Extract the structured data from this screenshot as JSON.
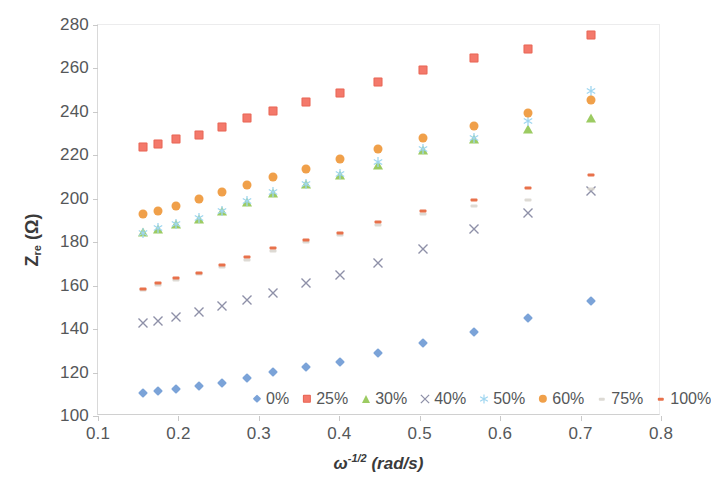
{
  "chart_data": {
    "type": "scatter",
    "title": "",
    "xlabel": "ω-1/2 (rad/s)",
    "ylabel": "Zre (Ω)",
    "xlim": [
      0.1,
      0.8
    ],
    "ylim": [
      100,
      280
    ],
    "xticks": [
      "0.1",
      "0.2",
      "0.3",
      "0.4",
      "0.5",
      "0.6",
      "0.7",
      "0.8"
    ],
    "yticks": [
      "100",
      "120",
      "140",
      "160",
      "180",
      "200",
      "220",
      "240",
      "260",
      "280"
    ],
    "grid": false,
    "legend_position": "bottom-inside",
    "x": [
      0.156,
      0.175,
      0.197,
      0.225,
      0.254,
      0.285,
      0.318,
      0.358,
      0.401,
      0.448,
      0.504,
      0.567,
      0.635,
      0.713
    ],
    "series": [
      {
        "name": "0%",
        "marker": "diamond",
        "color": "#7BA3D8",
        "values": [
          110.5,
          111.3,
          112.3,
          113.7,
          115.4,
          117.4,
          120.2,
          122.6,
          125.0,
          129.1,
          133.6,
          138.6,
          145.3,
          153.1
        ]
      },
      {
        "name": "25%",
        "marker": "square",
        "color": "#F4796B",
        "values": [
          223.9,
          225.2,
          227.4,
          229.4,
          232.9,
          237.0,
          240.6,
          244.7,
          248.9,
          253.6,
          259.2,
          264.6,
          269.0,
          275.2
        ]
      },
      {
        "name": "30%",
        "marker": "triangle",
        "color": "#9CCB62",
        "values": [
          184.8,
          186.0,
          188.3,
          190.6,
          194.4,
          198.5,
          202.6,
          207.0,
          211.0,
          215.7,
          222.4,
          227.4,
          232.3,
          237.0
        ]
      },
      {
        "name": "40%",
        "marker": "x",
        "color": "#8E90A8",
        "values": [
          142.8,
          143.6,
          145.5,
          147.7,
          150.6,
          153.4,
          156.5,
          161.2,
          165.1,
          170.6,
          176.7,
          185.9,
          193.5,
          203.6
        ]
      },
      {
        "name": "50%",
        "marker": "star",
        "color": "#9FD6F0",
        "values": [
          184.2,
          186.4,
          188.6,
          191.0,
          194.6,
          199.0,
          203.2,
          207.0,
          211.5,
          217.0,
          223.0,
          228.0,
          236.0,
          249.6
        ]
      },
      {
        "name": "60%",
        "marker": "circle",
        "color": "#F0A04A",
        "values": [
          193.0,
          194.4,
          196.9,
          200.0,
          203.3,
          206.4,
          210.0,
          213.8,
          218.2,
          223.0,
          228.0,
          233.5,
          239.5,
          245.3
        ]
      },
      {
        "name": "75%",
        "marker": "dash-faint",
        "color": "#D7D3CC",
        "values": [
          158.0,
          160.2,
          162.4,
          165.2,
          168.4,
          172.0,
          176.0,
          180.0,
          183.5,
          188.0,
          193.0,
          196.5,
          199.5,
          204.5
        ]
      },
      {
        "name": "100%",
        "marker": "dash",
        "color": "#E8714B",
        "values": [
          158.6,
          161.0,
          163.4,
          166.0,
          169.4,
          173.0,
          177.2,
          181.0,
          184.4,
          189.4,
          194.5,
          199.5,
          204.8,
          210.8
        ]
      }
    ]
  }
}
